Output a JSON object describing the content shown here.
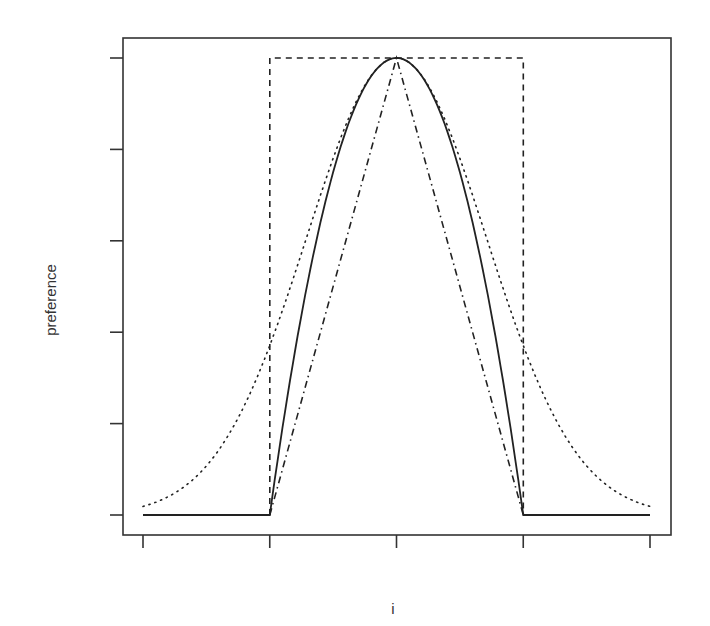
{
  "chart_data": {
    "type": "line",
    "title": "",
    "xlabel": "i",
    "ylabel": "preference",
    "xlim": [
      -2,
      2
    ],
    "ylim": [
      0,
      1
    ],
    "x_ticks": [
      -2,
      -1,
      0,
      1,
      2
    ],
    "y_ticks": [
      0,
      0.2,
      0.4,
      0.6,
      0.8,
      1.0
    ],
    "x_tick_labels": [
      "",
      "",
      "",
      "",
      ""
    ],
    "y_tick_labels": [
      "",
      "",
      "",
      "",
      "",
      ""
    ],
    "grid": false,
    "legend": null,
    "series": [
      {
        "name": "rectangular",
        "line_style": "dashed",
        "description": "1 for -1<=i<=1, 0 otherwise (drawn only as box from -1 to 1)",
        "x": [
          -1,
          -1,
          1,
          1
        ],
        "y": [
          0,
          1,
          1,
          0
        ]
      },
      {
        "name": "parabolic",
        "line_style": "solid",
        "description": "1 - i^2 for |i|<=1, 0 elsewhere",
        "x": [
          -2,
          -1,
          -0.75,
          -0.5,
          -0.25,
          0,
          0.25,
          0.5,
          0.75,
          1,
          2
        ],
        "y": [
          0,
          0,
          0.4375,
          0.75,
          0.9375,
          1,
          0.9375,
          0.75,
          0.4375,
          0,
          0
        ]
      },
      {
        "name": "triangular",
        "line_style": "dashdot",
        "description": "1 - |i| for |i|<=1",
        "x": [
          -1,
          0,
          1
        ],
        "y": [
          0,
          1,
          0
        ]
      },
      {
        "name": "gaussian",
        "line_style": "dotted",
        "description": "exp(-i^2 / (2*0.71^2))",
        "sigma": 0.71,
        "x": [
          -2,
          -1.5,
          -1,
          -0.5,
          0,
          0.5,
          1,
          1.5,
          2
        ],
        "y": [
          0.019,
          0.108,
          0.371,
          0.78,
          1,
          0.78,
          0.371,
          0.108,
          0.019
        ]
      }
    ]
  },
  "labels": {
    "x_axis": "i",
    "y_axis": "preference"
  },
  "layout": {
    "frame": {
      "left": 123,
      "top": 38,
      "right": 671,
      "bottom": 535
    },
    "x_pixel": {
      "min": 143,
      "max": 650
    },
    "y_pixel": {
      "zero": 515,
      "one": 58
    },
    "line_color": "#222222",
    "frame_color": "#333333"
  }
}
